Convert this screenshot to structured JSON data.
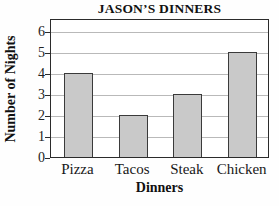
{
  "chart_data": {
    "type": "bar",
    "title": "JASON’S DINNERS",
    "xlabel": "Dinners",
    "ylabel": "Number of Nights",
    "categories": [
      "Pizza",
      "Tacos",
      "Steak",
      "Chicken"
    ],
    "values": [
      4,
      2,
      3,
      5
    ],
    "series": [
      {
        "name": "Number of Nights",
        "values": [
          4,
          2,
          3,
          5
        ]
      }
    ],
    "ylim": [
      0,
      6.6
    ],
    "yticks": [
      0,
      1,
      2,
      3,
      4,
      5,
      6
    ],
    "ytick_labels": [
      "0",
      "1",
      "2",
      "3",
      "4",
      "5",
      "6"
    ],
    "xlim": [
      0,
      4
    ],
    "grid": true,
    "grid_axis": "y",
    "legend": false,
    "legend_position": "none",
    "bar_fill_color": "#c9c9c9",
    "bar_edge_color": "#3a3a3a",
    "gridline_color": "#b9b9b9",
    "frame_color": "#2b2b2b",
    "background_color": "#ffffff"
  }
}
